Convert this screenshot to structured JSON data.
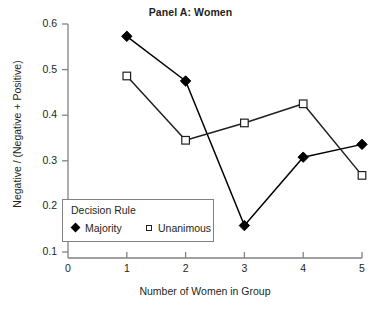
{
  "chart_data": {
    "type": "line",
    "title": "Panel A: Women",
    "xlabel": "Number of Women in Group",
    "ylabel": "Negative / (Negative + Positive)",
    "x": [
      1,
      2,
      3,
      4,
      5
    ],
    "xlim": [
      0,
      5
    ],
    "ylim": [
      0.1,
      0.6
    ],
    "xticks": [
      "0",
      "1",
      "2",
      "3",
      "4",
      "5"
    ],
    "yticks": [
      "0.1",
      "0.2",
      "0.3",
      "0.4",
      "0.5",
      "0.6"
    ],
    "grid": false,
    "legend_position": "lower-left-inside",
    "legend_title": "Decision Rule",
    "series": [
      {
        "name": "Majority",
        "marker": "filled-diamond",
        "color": "#000000",
        "values": [
          0.573,
          0.475,
          0.158,
          0.308,
          0.336
        ]
      },
      {
        "name": "Unanimous",
        "marker": "open-square",
        "color": "#231f20",
        "values": [
          0.486,
          0.345,
          0.383,
          0.425,
          0.268
        ]
      }
    ]
  },
  "legend": {
    "title": "Decision Rule",
    "items": [
      {
        "label": "Majority",
        "marker": "filled-diamond"
      },
      {
        "label": "Unanimous",
        "marker": "open-square"
      }
    ]
  },
  "colors": {
    "axis": "#808285",
    "series_majority": "#000000",
    "series_unanimous": "#231f20",
    "text": "#231f20",
    "background": "#ffffff"
  }
}
